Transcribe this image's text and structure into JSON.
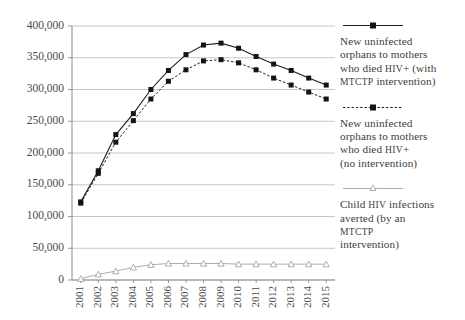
{
  "chart_data": {
    "type": "line",
    "title": "",
    "xlabel": "",
    "ylabel": "",
    "ylim": [
      0,
      400000
    ],
    "ytick_values": [
      0,
      50000,
      100000,
      150000,
      200000,
      250000,
      300000,
      350000,
      400000
    ],
    "ytick_labels": [
      "0",
      "50,000",
      "100,000",
      "150,000",
      "200,000",
      "250,000",
      "300,000",
      "350,000",
      "400,000"
    ],
    "grid": true,
    "legend_position": "right",
    "categories": [
      "2001",
      "2002",
      "2003",
      "2004",
      "2005",
      "2006",
      "2007",
      "2008",
      "2009",
      "2010",
      "2011",
      "2012",
      "2013",
      "2014",
      "2015"
    ],
    "series": [
      {
        "name": "New uninfected orphans to mothers who died HIV+ (with MTCTP intervention)",
        "marker": "square",
        "line_style": "solid",
        "color": "#1c1c1c",
        "values": [
          123000,
          172000,
          229000,
          262000,
          300000,
          330000,
          355000,
          370000,
          373000,
          365000,
          352000,
          340000,
          330000,
          318000,
          307000
        ]
      },
      {
        "name": "New uninfected orphans to mothers who died HIV+ (no intervention)",
        "marker": "square",
        "line_style": "dashed",
        "color": "#1c1c1c",
        "values": [
          121000,
          168000,
          217000,
          251000,
          285000,
          313000,
          331000,
          345000,
          347000,
          342000,
          331000,
          318000,
          307000,
          296000,
          285000
        ]
      },
      {
        "name": "Child HIV infections averted (by an MTCTP intervention)",
        "marker": "triangle",
        "line_style": "solid-light",
        "color": "#a4a4a4",
        "values": [
          2000,
          9000,
          14000,
          20000,
          24000,
          26000,
          26000,
          26000,
          26000,
          25000,
          25000,
          25000,
          25000,
          25000,
          25000
        ]
      }
    ]
  },
  "legend": {
    "entries": [
      {
        "swatch": "solid-line-square-marker",
        "line1": "New uninfected",
        "line2": "orphans to mothers",
        "line3_a": "who died ",
        "line3_b": "HIV",
        "line3_c": "+ (with",
        "line4_a": "MTCTP",
        "line4_b": " intervention)"
      },
      {
        "swatch": "dashed-line-square-marker",
        "line1": "New uninfected",
        "line2": "orphans to mothers",
        "line3_a": "who died ",
        "line3_b": "HIV",
        "line3_c": "+",
        "line4_a": "(no intervention)",
        "line4_b": ""
      },
      {
        "swatch": "light-line-triangle-marker",
        "line1_a": "Child ",
        "line1_b": "HIV",
        "line1_c": " infections",
        "line2": "averted (by an",
        "line3_a": "MTCTP",
        "line4": "intervention)"
      }
    ]
  }
}
